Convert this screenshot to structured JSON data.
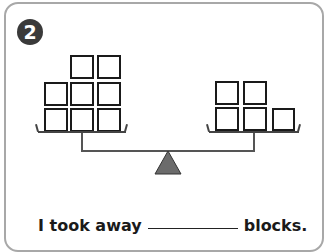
{
  "problem": {
    "number": "2",
    "sentence": {
      "before": "I took away",
      "blank_value": "",
      "after": "blocks."
    }
  },
  "balance": {
    "left_pan": {
      "block_count": 8,
      "rows": [
        [
          0,
          1,
          1
        ],
        [
          1,
          1,
          1
        ],
        [
          1,
          1,
          1
        ]
      ]
    },
    "right_pan": {
      "block_count": 5,
      "rows": [
        [
          1,
          1,
          0
        ],
        [
          1,
          1,
          1
        ]
      ]
    },
    "fulcrum_color": "#6b6b6b"
  }
}
